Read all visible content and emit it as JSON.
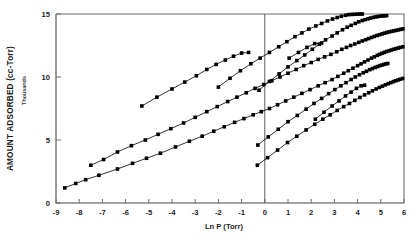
{
  "chart": {
    "type": "scatter",
    "title": "",
    "xlabel": "Ln P (Torr)",
    "ylabel": "AMOUNT ADSORBED (cc-Torr)",
    "ylabel_sub": "Thousands",
    "xlim": [
      -9,
      6
    ],
    "ylim": [
      0,
      15
    ],
    "xticks": [
      -9,
      -8,
      -7,
      -6,
      -5,
      -4,
      -3,
      -2,
      -1,
      0,
      1,
      2,
      3,
      4,
      5,
      6
    ],
    "yticks": [
      0,
      5,
      10,
      15
    ],
    "xtick_labels": [
      "-9",
      "-8",
      "-7",
      "-6",
      "-5",
      "-4",
      "-3",
      "-2",
      "-1",
      "0",
      "1",
      "2",
      "3",
      "4",
      "5",
      "6"
    ],
    "ytick_labels": [
      "0",
      "5",
      "10",
      "15"
    ],
    "grid": false,
    "legend": "none",
    "marker": "filled-square",
    "marker_color": "#000000",
    "line_color": "#000000",
    "annotations": [
      {
        "name": "zero-reference-line",
        "x": 0,
        "type": "vertical-line"
      }
    ]
  },
  "chart_data": {
    "type": "scatter",
    "title": "",
    "xlabel": "Ln P (Torr)",
    "ylabel": "AMOUNT ADSORBED (cc-Torr)",
    "ylabel_sub": "Thousands",
    "xlim": [
      -9,
      6
    ],
    "ylim": [
      0,
      15
    ],
    "xticks": [
      -9,
      -8,
      -7,
      -6,
      -5,
      -4,
      -3,
      -2,
      -1,
      0,
      1,
      2,
      3,
      4,
      5,
      6
    ],
    "yticks": [
      0,
      5,
      10,
      15
    ],
    "grid": false,
    "legend": "none",
    "series": [
      {
        "name": "isotherm-1-lowest",
        "x": [
          -8.62,
          -8.15,
          -7.72,
          -7.15,
          -6.35,
          -5.7,
          -5.1,
          -4.5,
          -3.85,
          -3.25,
          -2.7,
          -2.2,
          -1.75,
          -1.3,
          -0.9,
          -0.5,
          -0.15,
          0.2,
          0.55,
          0.9,
          1.25,
          1.6,
          1.95,
          2.3,
          2.6,
          2.9,
          3.15,
          3.4,
          3.6,
          3.8,
          4.0,
          4.15,
          4.3,
          4.45,
          4.6,
          4.72,
          4.85,
          4.95,
          5.05,
          5.15,
          5.25,
          5.35,
          5.45,
          5.55,
          5.65,
          5.75,
          5.85,
          5.95
        ],
        "y": [
          1.2,
          1.55,
          1.85,
          2.2,
          2.7,
          3.15,
          3.55,
          3.95,
          4.45,
          4.9,
          5.3,
          5.7,
          6.05,
          6.4,
          6.7,
          7.0,
          7.25,
          7.5,
          7.8,
          8.1,
          8.4,
          8.7,
          9.0,
          9.3,
          9.55,
          9.8,
          10.05,
          10.3,
          10.5,
          10.7,
          10.9,
          11.05,
          11.2,
          11.35,
          11.5,
          11.6,
          11.72,
          11.8,
          11.88,
          11.95,
          12.02,
          12.08,
          12.14,
          12.2,
          12.25,
          12.3,
          12.35,
          12.4
        ]
      },
      {
        "name": "isotherm-2",
        "x": [
          -7.5,
          -6.95,
          -6.35,
          -5.75,
          -5.15,
          -4.6,
          -4.05,
          -3.5,
          -3.0,
          -2.5,
          -2.05,
          -1.6,
          -1.2,
          -0.8,
          -0.42,
          -0.05,
          0.3,
          0.65,
          1.0,
          1.35,
          1.68,
          2.0,
          2.3,
          2.58,
          2.85,
          3.1,
          3.32,
          3.52,
          3.7,
          3.88,
          4.05,
          4.2,
          4.35,
          4.48,
          4.6,
          4.72,
          4.84,
          4.95,
          5.06,
          5.16,
          5.26,
          5.36,
          5.46,
          5.56,
          5.66,
          5.76,
          5.86,
          5.95
        ],
        "y": [
          3.0,
          3.45,
          4.05,
          4.55,
          5.0,
          5.45,
          5.9,
          6.35,
          6.8,
          7.25,
          7.65,
          8.05,
          8.4,
          8.75,
          9.1,
          9.4,
          9.7,
          10.0,
          10.3,
          10.6,
          10.9,
          11.15,
          11.4,
          11.6,
          11.8,
          12.0,
          12.2,
          12.35,
          12.5,
          12.62,
          12.75,
          12.86,
          12.96,
          13.05,
          13.14,
          13.22,
          13.3,
          13.36,
          13.42,
          13.48,
          13.53,
          13.58,
          13.62,
          13.66,
          13.7,
          13.74,
          13.78,
          13.82
        ]
      },
      {
        "name": "isotherm-3",
        "x": [
          -5.3,
          -4.65,
          -4.0,
          -3.45,
          -2.95,
          -2.5,
          -2.1,
          -1.7,
          -1.35,
          -1.0,
          -0.7
        ],
        "y": [
          7.7,
          8.4,
          9.05,
          9.6,
          10.1,
          10.6,
          11.0,
          11.35,
          11.65,
          11.9,
          11.95
        ]
      },
      {
        "name": "isotherm-4",
        "x": [
          -2.0,
          -1.5,
          -1.05,
          -0.6,
          -0.2,
          0.2,
          0.6,
          0.95,
          1.3,
          1.6,
          1.9,
          2.2,
          2.45,
          2.7,
          2.92,
          3.12,
          3.3,
          3.48,
          3.62,
          3.76,
          3.88,
          4.0,
          4.1,
          4.2
        ],
        "y": [
          9.2,
          9.9,
          10.5,
          11.05,
          11.5,
          11.95,
          12.4,
          12.8,
          13.2,
          13.5,
          13.8,
          14.05,
          14.25,
          14.45,
          14.6,
          14.72,
          14.82,
          14.9,
          14.95,
          14.97,
          14.98,
          14.99,
          15.0,
          15.0
        ]
      },
      {
        "name": "isotherm-5",
        "x": [
          -0.25,
          0.2,
          0.62,
          1.0,
          1.38,
          1.72,
          2.05,
          2.35,
          2.62,
          2.9,
          3.12,
          3.35,
          3.55,
          3.72,
          3.9,
          4.05,
          4.2,
          4.32,
          4.45,
          4.56,
          4.68,
          4.78,
          4.88,
          4.98,
          5.08,
          5.16,
          5.25
        ],
        "y": [
          8.95,
          9.65,
          10.25,
          10.8,
          11.3,
          11.75,
          12.2,
          12.6,
          12.95,
          13.25,
          13.5,
          13.75,
          13.95,
          14.1,
          14.25,
          14.38,
          14.48,
          14.55,
          14.62,
          14.68,
          14.73,
          14.77,
          14.8,
          14.83,
          14.85,
          14.86,
          14.87
        ]
      },
      {
        "name": "isotherm-6",
        "x": [
          -0.3,
          0.15,
          0.58,
          1.0,
          1.4,
          1.78,
          2.12,
          2.45,
          2.75,
          3.02,
          3.28,
          3.5,
          3.72,
          3.9,
          4.08,
          4.24,
          4.38,
          4.52,
          4.64,
          4.76,
          4.86,
          4.96,
          5.05,
          5.14,
          5.22,
          5.3
        ],
        "y": [
          4.6,
          5.25,
          5.85,
          6.45,
          6.95,
          7.45,
          7.9,
          8.3,
          8.68,
          9.0,
          9.3,
          9.55,
          9.8,
          10.0,
          10.18,
          10.33,
          10.45,
          10.58,
          10.67,
          10.76,
          10.83,
          10.9,
          10.95,
          11.0,
          11.04,
          11.07
        ]
      },
      {
        "name": "isotherm-7",
        "x": [
          -0.32,
          0.12,
          0.55,
          0.98,
          1.38,
          1.78,
          2.15,
          2.5,
          2.82,
          3.12,
          3.4,
          3.65,
          3.88,
          4.1,
          4.3,
          4.48,
          4.64,
          4.8,
          4.94,
          5.07,
          5.2,
          5.32,
          5.43,
          5.54,
          5.64,
          5.74,
          5.84,
          5.94
        ],
        "y": [
          3.0,
          3.6,
          4.2,
          4.8,
          5.3,
          5.8,
          6.25,
          6.65,
          7.0,
          7.35,
          7.65,
          7.9,
          8.15,
          8.38,
          8.58,
          8.75,
          8.9,
          9.05,
          9.17,
          9.28,
          9.38,
          9.47,
          9.55,
          9.63,
          9.7,
          9.76,
          9.82,
          9.88
        ]
      },
      {
        "name": "isotherm-8",
        "x": [
          1.05,
          1.45,
          1.82,
          2.15,
          2.45
        ],
        "y": [
          11.5,
          11.95,
          12.35,
          12.65,
          12.7
        ]
      },
      {
        "name": "isotherm-9",
        "x": [
          2.18,
          2.55,
          2.9,
          3.2,
          3.48,
          3.72,
          3.95,
          4.15,
          4.3
        ],
        "y": [
          6.65,
          7.2,
          7.7,
          8.1,
          8.5,
          8.8,
          9.1,
          9.3,
          9.35
        ]
      }
    ]
  }
}
